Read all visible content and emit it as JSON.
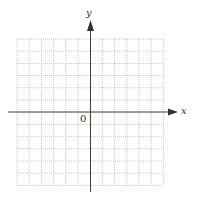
{
  "diagram": {
    "type": "coordinate-grid",
    "x_axis_label": "x",
    "y_axis_label": "y",
    "origin_label": "0",
    "grid": {
      "columns": 12,
      "rows": 12,
      "left_cells": 6,
      "right_cells": 6,
      "up_cells": 6,
      "down_cells": 6
    },
    "colors": {
      "grid": "#c8c8c8",
      "axis": "#444444",
      "background": "#ffffff"
    }
  }
}
